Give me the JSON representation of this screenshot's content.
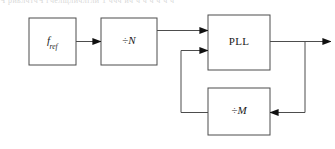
{
  "caption": {
    "text": "Ч  риьлчтчЧ   гчелщличлгли   1     ччч ич  ч   ч ч ч ч ч"
  },
  "diagram": {
    "stroke_color": "#4d4d4d",
    "text_color": "#1a1a1a",
    "background": "#ffffff",
    "blocks": [
      {
        "id": "fref",
        "name": "reference-source-block",
        "label_main": "f",
        "label_sub": "ref",
        "x": 29,
        "y": 18,
        "w": 47,
        "h": 47
      },
      {
        "id": "divn",
        "name": "divide-by-n-block",
        "label_sym": "÷",
        "label_var": "N",
        "x": 101,
        "y": 18,
        "w": 56,
        "h": 47
      },
      {
        "id": "pll",
        "name": "pll-block",
        "label_main": "PLL",
        "x": 208,
        "y": 15,
        "w": 62,
        "h": 55
      },
      {
        "id": "divm",
        "name": "divide-by-m-block",
        "label_sym": "÷",
        "label_var": "M",
        "x": 208,
        "y": 88,
        "w": 62,
        "h": 47
      }
    ],
    "connections": [
      {
        "name": "fref-to-divn-arrow",
        "from": "fref",
        "to": "divn"
      },
      {
        "name": "divn-to-pll-arrow",
        "from": "divn",
        "to": "pll"
      },
      {
        "name": "pll-output-arrow",
        "from": "pll",
        "to": "output"
      },
      {
        "name": "pll-output-to-divm-feedback",
        "from": "pll",
        "to": "divm"
      },
      {
        "name": "divm-to-pll-feedback-arrow",
        "from": "divm",
        "to": "pll"
      }
    ]
  }
}
